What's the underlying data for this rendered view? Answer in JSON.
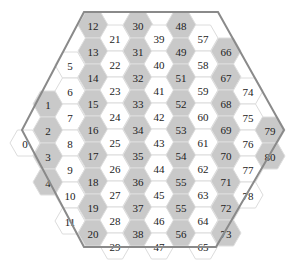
{
  "diagram": {
    "type": "hexagonal-grid",
    "outline_color": "#8a8a8a",
    "gray_fill": "#c9c9c9",
    "white_fill": "#ffffff",
    "outline_vertices": [
      [
        84,
        12
      ],
      [
        218,
        12
      ],
      [
        284,
        130
      ],
      [
        216,
        247
      ],
      [
        84,
        247
      ],
      [
        22,
        130
      ]
    ],
    "hex_radius": 15,
    "columns": [
      {
        "x": 25,
        "shade": "white",
        "cells": [
          {
            "label": "0",
            "y": 143
          }
        ]
      },
      {
        "x": 48,
        "shade": "gray",
        "cells": [
          {
            "label": "1",
            "y": 104
          },
          {
            "label": "2",
            "y": 130
          },
          {
            "label": "3",
            "y": 156
          },
          {
            "label": "4",
            "y": 182
          }
        ]
      },
      {
        "x": 70,
        "shade": "white",
        "cells": [
          {
            "label": "5",
            "y": 65
          },
          {
            "label": "6",
            "y": 91
          },
          {
            "label": "7",
            "y": 117
          },
          {
            "label": "8",
            "y": 143
          },
          {
            "label": "9",
            "y": 169
          },
          {
            "label": "10",
            "y": 195
          },
          {
            "label": "11",
            "y": 221
          }
        ]
      },
      {
        "x": 93,
        "shade": "gray",
        "cells": [
          {
            "label": "12",
            "y": 25
          },
          {
            "label": "13",
            "y": 51
          },
          {
            "label": "14",
            "y": 77
          },
          {
            "label": "15",
            "y": 103
          },
          {
            "label": "16",
            "y": 129
          },
          {
            "label": "17",
            "y": 155
          },
          {
            "label": "18",
            "y": 181
          },
          {
            "label": "19",
            "y": 207
          },
          {
            "label": "20",
            "y": 233
          }
        ]
      },
      {
        "x": 115,
        "shade": "white",
        "cells": [
          {
            "label": "21",
            "y": 38
          },
          {
            "label": "22",
            "y": 64
          },
          {
            "label": "23",
            "y": 90
          },
          {
            "label": "24",
            "y": 116
          },
          {
            "label": "25",
            "y": 142
          },
          {
            "label": "26",
            "y": 168
          },
          {
            "label": "27",
            "y": 194
          },
          {
            "label": "28",
            "y": 220
          },
          {
            "label": "29",
            "y": 246
          }
        ]
      },
      {
        "x": 138,
        "shade": "gray",
        "cells": [
          {
            "label": "30",
            "y": 25
          },
          {
            "label": "31",
            "y": 51
          },
          {
            "label": "32",
            "y": 77
          },
          {
            "label": "33",
            "y": 103
          },
          {
            "label": "34",
            "y": 129
          },
          {
            "label": "35",
            "y": 155
          },
          {
            "label": "36",
            "y": 181
          },
          {
            "label": "37",
            "y": 207
          },
          {
            "label": "38",
            "y": 233
          }
        ]
      },
      {
        "x": 159,
        "shade": "white",
        "cells": [
          {
            "label": "39",
            "y": 38
          },
          {
            "label": "40",
            "y": 64
          },
          {
            "label": "41",
            "y": 90
          },
          {
            "label": "42",
            "y": 116
          },
          {
            "label": "43",
            "y": 142
          },
          {
            "label": "44",
            "y": 168
          },
          {
            "label": "45",
            "y": 194
          },
          {
            "label": "46",
            "y": 220
          },
          {
            "label": "47",
            "y": 246
          }
        ]
      },
      {
        "x": 181,
        "shade": "gray",
        "cells": [
          {
            "label": "48",
            "y": 25
          },
          {
            "label": "49",
            "y": 51
          },
          {
            "label": "51",
            "y": 77
          },
          {
            "label": "52",
            "y": 103
          },
          {
            "label": "53",
            "y": 129
          },
          {
            "label": "54",
            "y": 155
          },
          {
            "label": "55",
            "y": 181
          },
          {
            "label": "55",
            "y": 207
          },
          {
            "label": "56",
            "y": 233
          }
        ]
      },
      {
        "x": 203,
        "shade": "white",
        "cells": [
          {
            "label": "57",
            "y": 38
          },
          {
            "label": "58",
            "y": 64
          },
          {
            "label": "59",
            "y": 90
          },
          {
            "label": "60",
            "y": 116
          },
          {
            "label": "61",
            "y": 142
          },
          {
            "label": "62",
            "y": 168
          },
          {
            "label": "63",
            "y": 194
          },
          {
            "label": "64",
            "y": 220
          },
          {
            "label": "65",
            "y": 246
          }
        ]
      },
      {
        "x": 226,
        "shade": "gray",
        "cells": [
          {
            "label": "66",
            "y": 51
          },
          {
            "label": "67",
            "y": 77
          },
          {
            "label": "68",
            "y": 103
          },
          {
            "label": "69",
            "y": 129
          },
          {
            "label": "70",
            "y": 155
          },
          {
            "label": "71",
            "y": 181
          },
          {
            "label": "72",
            "y": 207
          },
          {
            "label": "73",
            "y": 233
          }
        ]
      },
      {
        "x": 248,
        "shade": "white",
        "cells": [
          {
            "label": "74",
            "y": 91
          },
          {
            "label": "75",
            "y": 117
          },
          {
            "label": "76",
            "y": 143
          },
          {
            "label": "77",
            "y": 169
          },
          {
            "label": "78",
            "y": 195
          }
        ]
      },
      {
        "x": 270,
        "shade": "gray",
        "cells": [
          {
            "label": "79",
            "y": 130
          },
          {
            "label": "80",
            "y": 156
          }
        ]
      }
    ]
  }
}
